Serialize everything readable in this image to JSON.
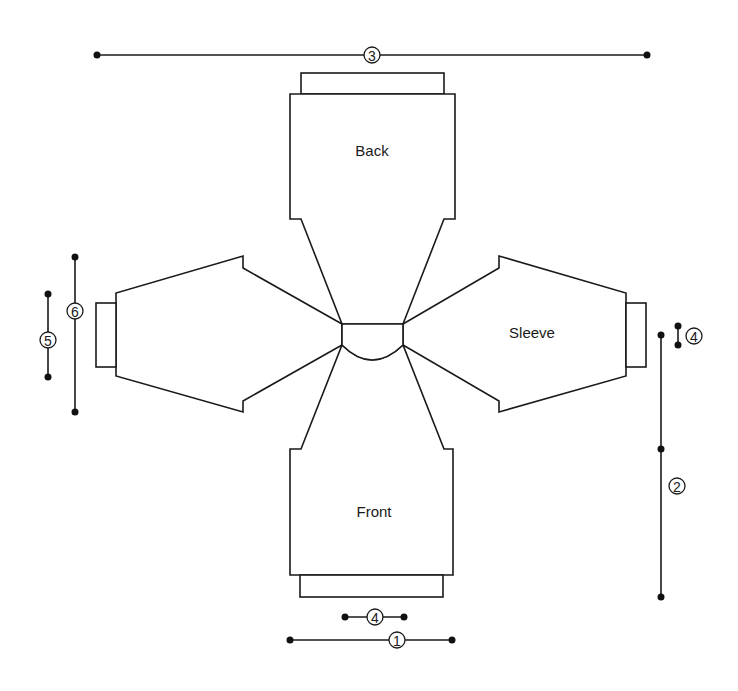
{
  "diagram": {
    "type": "raglan sweater schematic",
    "pieces": {
      "back": {
        "label": "Back"
      },
      "front": {
        "label": "Front"
      },
      "sleeve_right": {
        "label": "Sleeve"
      },
      "sleeve_left": {
        "label": ""
      }
    },
    "measurements": [
      {
        "id": "1",
        "label": "1",
        "description": "front bottom width"
      },
      {
        "id": "2",
        "label": "2",
        "description": "body length (right side)"
      },
      {
        "id": "3",
        "label": "3",
        "description": "overall width (cuff to cuff)"
      },
      {
        "id": "4a",
        "label": "4",
        "description": "neck width (below front)"
      },
      {
        "id": "4b",
        "label": "4",
        "description": "rib depth (right side)"
      },
      {
        "id": "5",
        "label": "5",
        "description": "cuff width"
      },
      {
        "id": "6",
        "label": "6",
        "description": "upper sleeve width"
      }
    ],
    "colors": {
      "line": "#1a1a1a",
      "background": "#ffffff"
    }
  }
}
